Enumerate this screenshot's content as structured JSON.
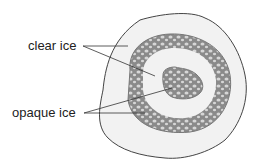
{
  "diagram": {
    "labels": [
      {
        "id": "clear",
        "text": "clear ice"
      },
      {
        "id": "opaque",
        "text": "opaque ice"
      }
    ],
    "colors": {
      "clear_ice_fill": "#f1f1f1",
      "outline": "#444444",
      "opaque_band": "#8a8a8a",
      "bubble": "#d9d9d9",
      "leader_line": "#333333"
    }
  }
}
